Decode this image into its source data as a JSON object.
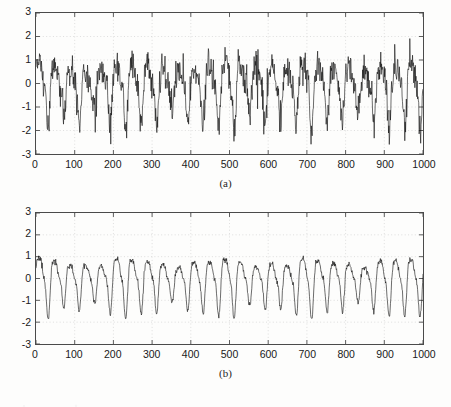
{
  "figure": {
    "background_color": "#fdfdfc",
    "line_color": "#101010",
    "axis_color": "#4a4a4a",
    "grid_color": "#c9c9c9"
  },
  "panels": [
    {
      "id": "a",
      "caption": "(a)",
      "box": {
        "left": 35,
        "top": 12,
        "width": 389,
        "height": 143
      }
    },
    {
      "id": "b",
      "caption": "(b)",
      "box": {
        "left": 35,
        "top": 212,
        "width": 389,
        "height": 133
      }
    }
  ],
  "chart_data": [
    {
      "type": "line",
      "title": "",
      "subtitle": "",
      "panel_label": "(a)",
      "xlabel": "",
      "ylabel": "",
      "xlim": [
        0,
        1000
      ],
      "ylim": [
        -3,
        3
      ],
      "xticks": [
        0,
        100,
        200,
        300,
        400,
        500,
        600,
        700,
        800,
        900,
        1000
      ],
      "xticklabels": [
        "0",
        "100",
        "200",
        "300",
        "400",
        "500",
        "600",
        "700",
        "800",
        "900",
        "1000"
      ],
      "yticks": [
        -3,
        -2,
        -1,
        0,
        1,
        2,
        3
      ],
      "yticklabels": [
        "-3",
        "-2",
        "-1",
        "0",
        "1",
        "2",
        "3"
      ],
      "grid": true,
      "legend": null,
      "series": [
        {
          "name": "noisy signal",
          "color": "#101010",
          "description": "noisy quasi-periodic oscillation, period about 40 samples, sawtooth-like rise with sharp peaks, heavy additive noise",
          "period": 40,
          "amplitude": 1.1,
          "noise_std": 0.34,
          "mean_offset": -0.15,
          "observed_min": -2.6,
          "observed_max": 2.25,
          "n_points": 1000
        }
      ]
    },
    {
      "type": "line",
      "title": "",
      "subtitle": "",
      "panel_label": "(b)",
      "xlabel": "",
      "ylabel": "",
      "xlim": [
        0,
        1000
      ],
      "ylim": [
        -3,
        3
      ],
      "xticks": [
        0,
        100,
        200,
        300,
        400,
        500,
        600,
        700,
        800,
        900,
        1000
      ],
      "xticklabels": [
        "0",
        "100",
        "200",
        "300",
        "400",
        "500",
        "600",
        "700",
        "800",
        "900",
        "1000"
      ],
      "yticks": [
        -3,
        -2,
        -1,
        0,
        1,
        2,
        3
      ],
      "yticklabels": [
        "-3",
        "-2",
        "-1",
        "0",
        "1",
        "2",
        "3"
      ],
      "grid": true,
      "legend": null,
      "series": [
        {
          "name": "denoised signal",
          "color": "#101010",
          "description": "smoothed quasi-periodic oscillation, period about 40 samples, low residual noise",
          "period": 40,
          "amplitude": 1.05,
          "noise_std": 0.07,
          "mean_offset": -0.1,
          "observed_min": -1.85,
          "observed_max": 1.45,
          "n_points": 1000
        }
      ]
    }
  ]
}
